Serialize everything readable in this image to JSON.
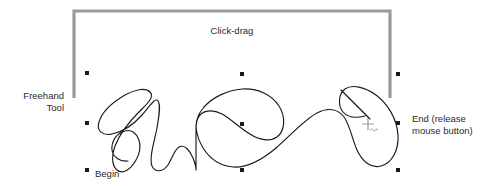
{
  "figure": {
    "title_absent": true,
    "background_color": "#ffffff"
  },
  "annotations": {
    "freehand_tool_label": "Freehand\nTool",
    "click_drag_label": "Click-drag",
    "begin_label": "Begin",
    "end_label": "End (release\nmouse button)"
  },
  "colors": {
    "text": "#2b2b2b",
    "bracket": "#9a9a9a",
    "stroke": "#1a1a1a",
    "handle": "#1a1a1a",
    "cursor": "#9a9a9a"
  },
  "bracket": {
    "name": "click-drag-bracket",
    "left_x": 74,
    "right_x": 390,
    "top_y": 11,
    "bottom_y": 98,
    "thickness": 3
  },
  "selection_handles": [
    {
      "name": "handle-top-left",
      "x": 87,
      "y": 73
    },
    {
      "name": "handle-top-center",
      "x": 242,
      "y": 74
    },
    {
      "name": "handle-top-right",
      "x": 398,
      "y": 74
    },
    {
      "name": "handle-middle-left",
      "x": 87,
      "y": 123
    },
    {
      "name": "handle-middle-center",
      "x": 242,
      "y": 124
    },
    {
      "name": "handle-middle-right",
      "x": 398,
      "y": 123
    },
    {
      "name": "handle-bottom-left",
      "x": 87,
      "y": 170
    },
    {
      "name": "handle-bottom-center",
      "x": 242,
      "y": 170
    },
    {
      "name": "handle-bottom-right",
      "x": 398,
      "y": 170
    }
  ],
  "freehand_stroke": {
    "name": "freehand-path",
    "begin_point": {
      "x": 128,
      "y": 161
    },
    "end_point": {
      "x": 371,
      "y": 119
    },
    "path": "M128,161 C120,162 113,157 112,150 C111,141 117,133 125,131 C132,129 137,134 139,140 C141,147 139,155 136,160 C131,169 123,175 117,170 C111,165 112,154 115,146 C120,133 130,121 139,112 C147,104 155,97 150,92 C145,87 134,90 125,95 C113,102 102,112 99,122 C96,131 103,136 112,134 C123,132 134,124 142,115 C150,106 155,97 158,101 C161,105 159,116 157,128 C154,143 149,158 152,166 C155,173 163,172 168,165 C172,159 174,150 179,147 C185,144 190,151 193,158 C195,163 196,168 196,170 L196,126 C196,120 199,113 204,107 C213,97 228,90 242,89 C258,88 272,95 279,106 C286,117 285,131 277,137 C270,142 259,140 250,134 C240,128 231,119 222,114 C212,109 202,110 198,118 C194,126 197,138 203,148 C210,159 221,166 233,167 C248,168 263,159 276,148 C291,135 304,120 317,113 C328,107 338,109 344,117 C350,125 352,139 357,150 C362,161 371,169 381,166 C392,163 399,150 398,135 C397,119 388,104 376,95 C365,87 352,84 345,89 C338,94 338,106 343,112 C348,118 357,118 365,116 C371,115 371,119 371,119"
  },
  "freehand_tail": {
    "name": "freehand-tail-segment",
    "path": "M341,90 L371,120"
  },
  "cursor": {
    "name": "freehand-cursor",
    "x": 368,
    "y": 124,
    "glyph": "crosshair-with-squiggle"
  }
}
